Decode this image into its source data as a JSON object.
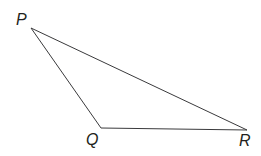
{
  "figure": {
    "type": "geometry-diagram",
    "shape": "triangle",
    "background_color": "#ffffff",
    "stroke_color": "#3a3a3c",
    "label_color": "#231f20",
    "stroke_width": 1,
    "canvas": {
      "width": 261,
      "height": 156
    },
    "vertices": [
      {
        "name": "P",
        "label": "P",
        "x": 31,
        "y": 28,
        "label_x": 16,
        "label_y": 12
      },
      {
        "name": "Q",
        "label": "Q",
        "x": 101,
        "y": 128,
        "label_x": 86,
        "label_y": 132
      },
      {
        "name": "R",
        "label": "R",
        "x": 247,
        "y": 130,
        "label_x": 239,
        "label_y": 133
      }
    ],
    "edges": [
      {
        "name": "PQ",
        "from": "P",
        "to": "Q"
      },
      {
        "name": "QR",
        "from": "Q",
        "to": "R"
      },
      {
        "name": "PR",
        "from": "P",
        "to": "R"
      }
    ],
    "path": "M 31 28 L 101 128 L 247 130 Z"
  }
}
